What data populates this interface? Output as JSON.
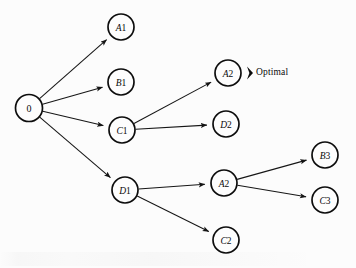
{
  "figure": {
    "type": "tree-diagram",
    "background_color": "#fcfcfc",
    "stroke_color": "#0d0d0d",
    "node_radius": 13,
    "annotation": {
      "label": "Optimal",
      "marker": "left-arrowhead-marker",
      "attached_to_node": "A2",
      "marker_color": "#0a0a0a",
      "marker_x": 247,
      "marker_y": 73,
      "text_x": 256,
      "text_y": 67
    },
    "nodes": [
      {
        "id": "root",
        "label_letter": "",
        "label_digit": "0",
        "x": 29,
        "y": 108,
        "r": 13.5
      },
      {
        "id": "A1",
        "label_letter": "A",
        "label_digit": "1",
        "x": 121,
        "y": 27,
        "r": 13
      },
      {
        "id": "B1",
        "label_letter": "B",
        "label_digit": "1",
        "x": 121,
        "y": 82,
        "r": 13
      },
      {
        "id": "C1",
        "label_letter": "C",
        "label_digit": "1",
        "x": 122,
        "y": 130,
        "r": 13
      },
      {
        "id": "D1",
        "label_letter": "D",
        "label_digit": "1",
        "x": 125,
        "y": 190,
        "r": 13
      },
      {
        "id": "A2u",
        "label_letter": "A",
        "label_digit": "2",
        "x": 228,
        "y": 73,
        "r": 13
      },
      {
        "id": "D2",
        "label_letter": "D",
        "label_digit": "2",
        "x": 226,
        "y": 124,
        "r": 13
      },
      {
        "id": "A2l",
        "label_letter": "A",
        "label_digit": "2",
        "x": 224,
        "y": 183,
        "r": 13
      },
      {
        "id": "C2",
        "label_letter": "C",
        "label_digit": "2",
        "x": 226,
        "y": 240,
        "r": 13
      },
      {
        "id": "B3",
        "label_letter": "B",
        "label_digit": "3",
        "x": 325,
        "y": 155,
        "r": 13
      },
      {
        "id": "C3",
        "label_letter": "C",
        "label_digit": "3",
        "x": 325,
        "y": 200,
        "r": 13
      }
    ],
    "edges": [
      {
        "from": "root",
        "to": "A1",
        "arrow": true
      },
      {
        "from": "root",
        "to": "B1",
        "arrow": true
      },
      {
        "from": "root",
        "to": "C1",
        "arrow": true
      },
      {
        "from": "root",
        "to": "D1",
        "arrow": true
      },
      {
        "from": "C1",
        "to": "A2u",
        "arrow": true
      },
      {
        "from": "C1",
        "to": "D2",
        "arrow": true
      },
      {
        "from": "D1",
        "to": "A2l",
        "arrow": true
      },
      {
        "from": "D1",
        "to": "C2",
        "arrow": true
      },
      {
        "from": "A2l",
        "to": "B3",
        "arrow": true
      },
      {
        "from": "A2l",
        "to": "C3",
        "arrow": true
      }
    ]
  }
}
